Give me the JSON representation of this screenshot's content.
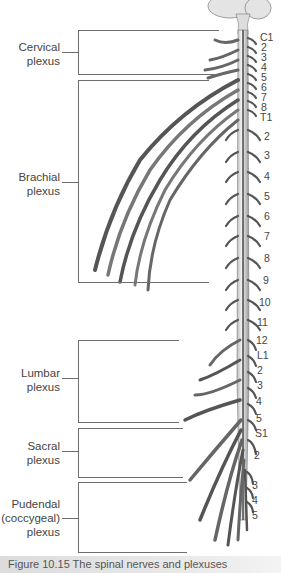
{
  "diagram": {
    "type": "anatomical illustration",
    "plexuses": [
      {
        "name": "cervical",
        "label_line1": "Cervical",
        "label_line2": "plexus",
        "label_line3": ""
      },
      {
        "name": "brachial",
        "label_line1": "Brachial",
        "label_line2": "plexus",
        "label_line3": ""
      },
      {
        "name": "lumbar",
        "label_line1": "Lumbar",
        "label_line2": "plexus",
        "label_line3": ""
      },
      {
        "name": "sacral",
        "label_line1": "Sacral",
        "label_line2": "plexus",
        "label_line3": ""
      },
      {
        "name": "pudendal",
        "label_line1": "Pudendal",
        "label_line2": "(coccygeal)",
        "label_line3": "plexus"
      }
    ],
    "segments": [
      "C1",
      "2",
      "3",
      "4",
      "5",
      "6",
      "7",
      "8",
      "T1",
      "2",
      "3",
      "4",
      "5",
      "6",
      "7",
      "8",
      "9",
      "10",
      "11",
      "12",
      "L1",
      "2",
      "3",
      "4",
      "5",
      "S1",
      "2",
      "3",
      "4",
      "5"
    ],
    "colors": {
      "line": "#6e6e6e",
      "text": "#444444",
      "nerve_fill": "#f2f2f2",
      "nerve_shadow": "#1a1a1a",
      "caption_bg": "#dcdcdc"
    }
  },
  "caption": {
    "text": "Figure 10.15  The spinal nerves and plexuses"
  }
}
